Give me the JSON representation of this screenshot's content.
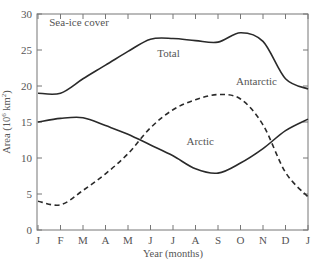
{
  "chart_data": {
    "type": "line",
    "title": "Sea-ice cover",
    "xlabel": "Year (months)",
    "ylabel": "Area (10⁶ km²)",
    "ylabel_main": "Area (10",
    "ylabel_sup": "6",
    "ylabel_unit": " km",
    "ylabel_sup2": "2",
    "ylabel_close": ")",
    "x": [
      "J",
      "F",
      "M",
      "A",
      "M",
      "J",
      "J",
      "A",
      "S",
      "O",
      "N",
      "D",
      "J"
    ],
    "yticks": [
      0,
      5,
      10,
      15,
      20,
      25,
      30
    ],
    "ylim": [
      0,
      30
    ],
    "grid": false,
    "legend": "inline labels",
    "series": [
      {
        "name": "Total",
        "style": "solid",
        "values": [
          19.0,
          19.0,
          21.0,
          22.9,
          24.8,
          26.5,
          26.6,
          26.3,
          26.1,
          27.4,
          26.2,
          21.0,
          19.6
        ]
      },
      {
        "name": "Arctic",
        "style": "solid",
        "values": [
          15.0,
          15.5,
          15.6,
          14.5,
          13.3,
          11.8,
          10.3,
          8.5,
          7.9,
          9.3,
          11.3,
          13.8,
          15.4
        ]
      },
      {
        "name": "Antarctic",
        "style": "dashed",
        "values": [
          4.0,
          3.5,
          5.5,
          7.8,
          10.6,
          14.2,
          16.7,
          18.1,
          18.8,
          18.2,
          14.6,
          8.0,
          4.6
        ]
      }
    ],
    "annotations": [
      {
        "text": "Sea-ice cover",
        "x": 0.5,
        "y": 28.3
      },
      {
        "text": "Total",
        "x": 5.3,
        "y": 24.0
      },
      {
        "text": "Antarctic",
        "x": 8.8,
        "y": 20.2
      },
      {
        "text": "Arctic",
        "x": 6.6,
        "y": 11.8
      }
    ]
  },
  "colors": {
    "line": "#2a2a2a",
    "axis": "#777777",
    "text": "#555555"
  }
}
